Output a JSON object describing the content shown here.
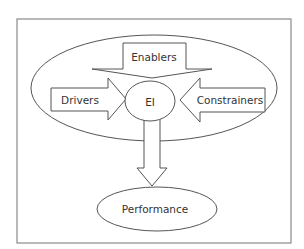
{
  "diagram": {
    "title": "",
    "nodes": {
      "enablers": {
        "label": "Enablers",
        "type": "arrow-down"
      },
      "drivers": {
        "label": "Drivers",
        "type": "arrow-right"
      },
      "ei": {
        "label": "EI",
        "type": "ellipse"
      },
      "constrainers": {
        "label": "Constrainers",
        "type": "arrow-left"
      },
      "performance": {
        "label": "Performance",
        "type": "ellipse"
      }
    },
    "edges": [
      {
        "from": "enablers",
        "to": "ei"
      },
      {
        "from": "drivers",
        "to": "ei"
      },
      {
        "from": "constrainers",
        "to": "ei"
      },
      {
        "from": "ei",
        "to": "performance"
      }
    ],
    "groups": [
      {
        "name": "context-ellipse",
        "contains": [
          "enablers",
          "drivers",
          "ei",
          "constrainers"
        ]
      }
    ],
    "colors": {
      "stroke": "#555555",
      "frame": "#8a8a8a",
      "text": "#333333",
      "background": "#ffffff"
    }
  }
}
